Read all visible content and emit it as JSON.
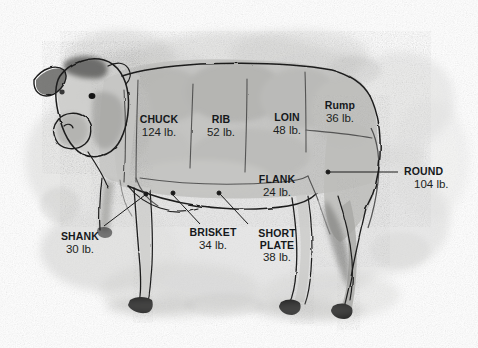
{
  "figure": {
    "type": "illustration-diagram",
    "medium": "grayscale watercolor and ink drawing",
    "background_color": "#ffffff",
    "wash_color": "#c9c9c7",
    "ink_color": "#1a1a1a",
    "text_color": "#15181b"
  },
  "cuts": [
    {
      "id": "chuck",
      "name": "CHUCK",
      "weight": "124 lb.",
      "lines": 1
    },
    {
      "id": "rib",
      "name": "RIB",
      "weight": "52 lb.",
      "lines": 1
    },
    {
      "id": "loin",
      "name": "LOIN",
      "weight": "48 lb.",
      "lines": 1
    },
    {
      "id": "rump",
      "name": "Rump",
      "weight": "36 lb.",
      "lines": 1
    },
    {
      "id": "round",
      "name": "ROUND",
      "weight": "104 lb.",
      "lines": 1
    },
    {
      "id": "flank",
      "name": "FLANK",
      "weight": "24 lb.",
      "lines": 1
    },
    {
      "id": "shank",
      "name": "SHANK",
      "weight": "30 lb.",
      "lines": 1
    },
    {
      "id": "brisket",
      "name": "BRISKET",
      "weight": "34 lb.",
      "lines": 1
    },
    {
      "id": "short-plate",
      "name": "SHORT",
      "name2": "PLATE",
      "weight": "38 lb.",
      "lines": 2
    }
  ]
}
